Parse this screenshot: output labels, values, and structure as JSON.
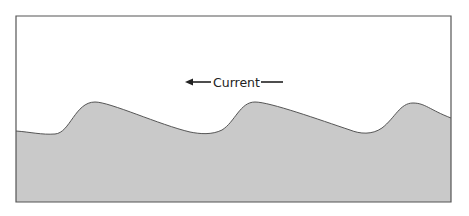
{
  "diagram": {
    "type": "cross-section",
    "label": {
      "text": "Current",
      "direction": "left",
      "arrow_icon": "arrow-left-icon"
    },
    "colors": {
      "background": "#ffffff",
      "sediment_fill": "#c9c9c9",
      "outline": "#555555",
      "frame": "#555555",
      "text": "#222222"
    },
    "ripples": {
      "count": 3,
      "crests": [
        {
          "x": 95,
          "y": 102
        },
        {
          "x": 253,
          "y": 102
        },
        {
          "x": 413,
          "y": 103
        }
      ],
      "troughs": [
        {
          "x": 45,
          "y": 134
        },
        {
          "x": 205,
          "y": 134
        },
        {
          "x": 365,
          "y": 134
        }
      ]
    }
  }
}
